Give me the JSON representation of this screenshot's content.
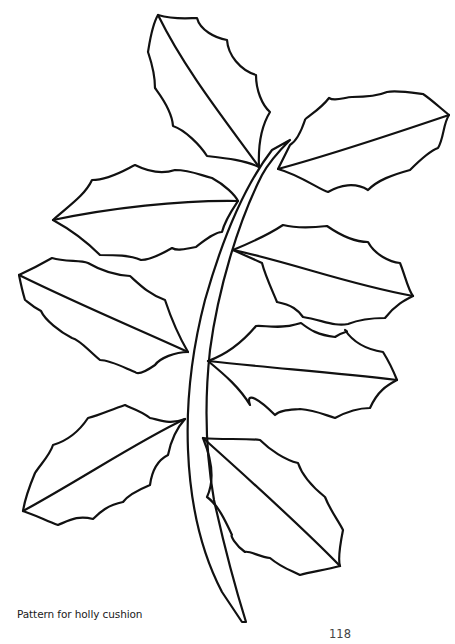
{
  "figure": {
    "leaf_count": 9,
    "stroke_color": "#111111",
    "background_color": "#ffffff"
  },
  "caption": "Pattern for holly cushion",
  "page_number": "118"
}
